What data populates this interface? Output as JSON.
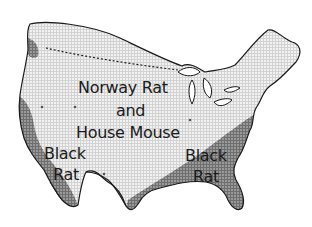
{
  "map": {
    "subject": "Distribution of commensal rodents in the continental United States",
    "style": "grayscale halftone grid",
    "colors": {
      "background": "#ffffff",
      "light_region_fill": "#d9d9d9",
      "grid_line": "#ffffff",
      "dark_region_fill": "#7a7a7a",
      "outline": "#1a1a1a",
      "label_text": "#1a1a1a"
    },
    "regions": [
      {
        "id": "norway-rat-house-mouse",
        "label_lines": [
          "Norway Rat",
          "and",
          "House Mouse"
        ],
        "shade": "light"
      },
      {
        "id": "black-rat-west",
        "label_lines": [
          "Black",
          "Rat"
        ],
        "shade": "dark"
      },
      {
        "id": "black-rat-southeast",
        "label_lines": [
          "Black",
          "Rat"
        ],
        "shade": "dark"
      }
    ],
    "features": {
      "northern_boundary": "dashed line",
      "southern_border": "solid line"
    }
  }
}
